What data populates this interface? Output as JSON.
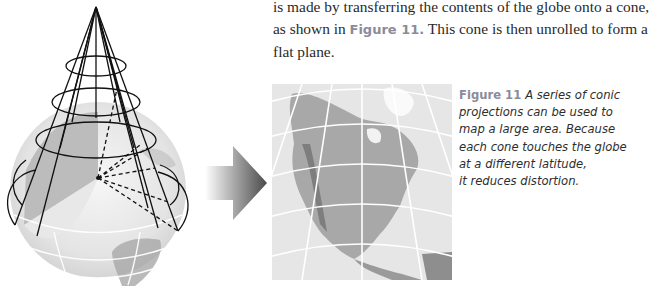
{
  "body_text": {
    "lines": [
      "is made by transferring the contents of the globe onto a cone,",
      "as shown in ",
      "This cone is then unrolled to form a",
      "flat plane."
    ],
    "figure_reference": "Figure 11."
  },
  "figure": {
    "label": "Figure 11",
    "caption_lines": [
      "A series of conic",
      "projections can be used to",
      "map a large area. Because",
      "each cone touches the globe",
      "at a different latitude,",
      "it reduces distortion."
    ],
    "images": {
      "left": "cone-over-globe-illustration",
      "arrow": "right-arrow",
      "right": "conic-projection-map-north-america"
    }
  },
  "colors": {
    "figure_label": "#8b8b9b",
    "text": "#2a2a2a",
    "cone_lines": "#111111",
    "globe_gray": "#d8d8d8"
  }
}
